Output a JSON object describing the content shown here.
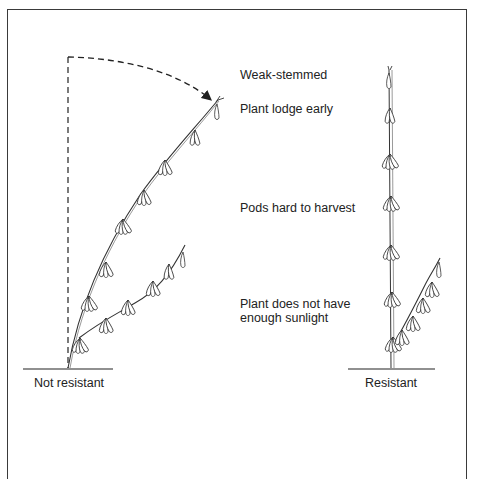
{
  "diagram": {
    "title": "",
    "annotations": {
      "weak_stemmed": "Weak-stemmed",
      "lodge_early": "Plant lodge early",
      "pods_hard": "Pods hard to harvest",
      "sunlight_line1": "Plant does not have",
      "sunlight_line2": "enough sunlight"
    },
    "plants": {
      "left": {
        "caption": "Not resistant",
        "state": "lodged"
      },
      "right": {
        "caption": "Resistant",
        "state": "upright"
      }
    },
    "colors": {
      "ink": "#222222",
      "frame": "#3a3a3a",
      "background": "#ffffff"
    }
  }
}
